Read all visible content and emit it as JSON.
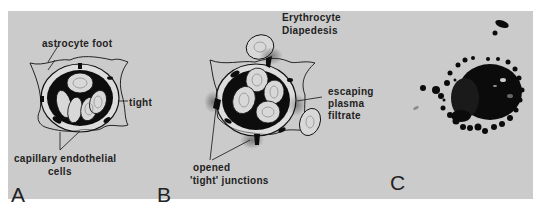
{
  "figure": {
    "background_color": "#cbcbcb",
    "ink_color": "#111111",
    "panels": [
      {
        "id": "A",
        "letter": "A",
        "labels": {
          "astrocyte_foot": "astrocyte foot",
          "tight": "tight",
          "capillary_line1": "capillary endothelial",
          "capillary_line2": "cells"
        }
      },
      {
        "id": "B",
        "letter": "B",
        "labels": {
          "erythrocyte_line1": "Erythrocyte",
          "erythrocyte_line2": "Diapedesis",
          "escaping_line1": "escaping",
          "escaping_line2": "plasma",
          "escaping_line3": "filtrate",
          "opened_line1": "opened",
          "opened_line2": "'tight' junctions"
        }
      },
      {
        "id": "C",
        "letter": "C"
      }
    ]
  }
}
